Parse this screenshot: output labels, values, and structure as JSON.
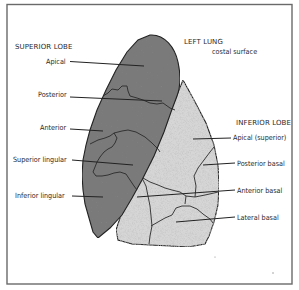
{
  "diagram": {
    "title": "LEFT LUNG",
    "subtitle": "costal surface",
    "colors": {
      "superior_lobe_fill": "#7a7a7a",
      "inferior_lobe_fill": "#d9d9d9",
      "outline": "#222222",
      "border": "#6a6a6a",
      "background": "#ffffff"
    },
    "superior_lobe": {
      "heading": "SUPERIOR LOBE",
      "segments": [
        {
          "label": "Apical"
        },
        {
          "label": "Posterior"
        },
        {
          "label": "Anterior"
        },
        {
          "label": "Superior lingular"
        },
        {
          "label": "Inferior lingular"
        }
      ]
    },
    "inferior_lobe": {
      "heading": "INFERIOR LOBE",
      "segments": [
        {
          "label": "Apical (superior)"
        },
        {
          "label": "Posterior basal"
        },
        {
          "label": "Anterior basal"
        },
        {
          "label": "Lateral basal"
        }
      ]
    }
  }
}
